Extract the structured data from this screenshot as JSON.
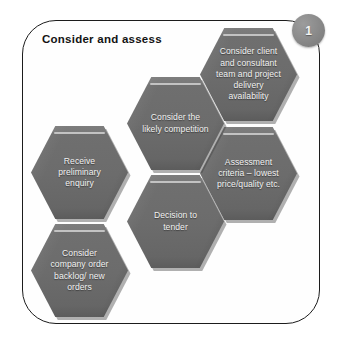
{
  "title": "Consider and assess",
  "badge": {
    "name": "step-number-badge",
    "number": "1",
    "color": "#8c8c8c",
    "text_color": "#f4f4f4"
  },
  "frame": {
    "border_color": "#1c1c1c",
    "background": "#fefefe",
    "corner_radius": "34px"
  },
  "style": {
    "hexagon_fill": "#6c6c6c",
    "hexagon_text_color": "#f2f2f2",
    "title_color": "#131313",
    "page_background": "#ffffff"
  },
  "hexagons": [
    {
      "id": "client-consultant",
      "label": "Consider client\nand consultant\nteam and  project\ndelivery\navailability"
    },
    {
      "id": "competition",
      "label": "Consider the\nlikely competition"
    },
    {
      "id": "assessment",
      "label": "Assessment\ncriteria – lowest\nprice/quality etc."
    },
    {
      "id": "receive-enquiry",
      "label": "Receive\npreliminary\nenquiry"
    },
    {
      "id": "decision-tender",
      "label": "Decision to\ntender"
    },
    {
      "id": "backlog-orders",
      "label": "Consider\ncompany order\nbacklog/ new\norders"
    }
  ]
}
